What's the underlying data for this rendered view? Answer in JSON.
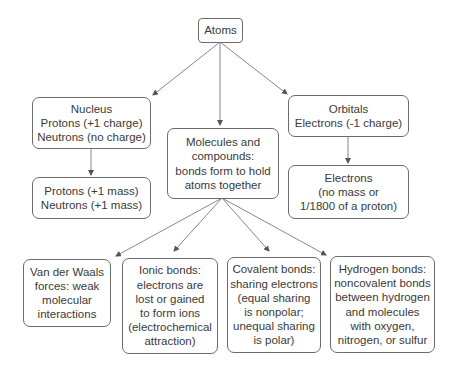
{
  "diagram": {
    "nodes": {
      "atoms": {
        "label": "Atoms"
      },
      "nucleus": {
        "label": "Nucleus\nProtons (+1 charge)\nNeutrons (no charge)"
      },
      "nucleus_mass": {
        "label": "Protons (+1 mass)\nNeutrons (+1 mass)"
      },
      "molecules": {
        "label": "Molecules and\ncompounds:\nbonds form to hold\natoms together"
      },
      "orbitals": {
        "label": "Orbitals\nElectrons (-1 charge)"
      },
      "electrons_mass": {
        "label": "Electrons\n(no mass or\n1/1800 of a proton)"
      },
      "van_der_waals": {
        "label": "Van der Waals\nforces: weak\nmolecular\ninteractions"
      },
      "ionic": {
        "label": "Ionic bonds:\nelectrons are\nlost or gained\nto form ions\n(electrochemical\nattraction)"
      },
      "covalent": {
        "label": "Covalent bonds:\nsharing electrons\n(equal sharing\nis nonpolar;\nunequal sharing\nis polar)"
      },
      "hydrogen": {
        "label": "Hydrogen bonds:\nnoncovalent bonds\nbetween hydrogen\nand molecules\nwith oxygen,\nnitrogen, or sulfur"
      }
    },
    "edges": [
      {
        "from": "atoms",
        "to": "nucleus"
      },
      {
        "from": "atoms",
        "to": "molecules"
      },
      {
        "from": "atoms",
        "to": "orbitals"
      },
      {
        "from": "nucleus",
        "to": "nucleus_mass"
      },
      {
        "from": "orbitals",
        "to": "electrons_mass"
      },
      {
        "from": "molecules",
        "to": "van_der_waals"
      },
      {
        "from": "molecules",
        "to": "ionic"
      },
      {
        "from": "molecules",
        "to": "covalent"
      },
      {
        "from": "molecules",
        "to": "hydrogen"
      }
    ],
    "colors": {
      "stroke": "#6b6b6b",
      "text": "#3a3a3a",
      "background": "#ffffff"
    }
  }
}
